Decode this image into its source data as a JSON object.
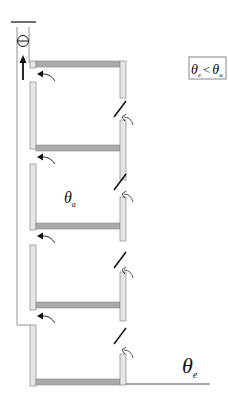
{
  "diagram": {
    "title": "",
    "colors": {
      "wall_fill": "#e6e6e6",
      "wall_stroke": "#808080",
      "floor_fill": "#aaaaaa",
      "line": "#111111",
      "background": "#ffffff"
    },
    "condition_box": {
      "lhs_symbol": "θ",
      "lhs_subscript": "e",
      "operator": "<",
      "rhs_symbol": "θ",
      "rhs_subscript": "a"
    },
    "interior_label": {
      "symbol": "θ",
      "subscript": "a"
    },
    "exterior_label": {
      "symbol": "θ",
      "subscript": "e"
    },
    "components": {
      "floors": 5,
      "exhaust_fan": "fan-symbol-at-top-of-shaft",
      "shaft_flow": "upward-arrow",
      "inlet_windows": 4,
      "airflow_arrows_shaft_side": 4,
      "airflow_arrows_facade_side": 4
    }
  }
}
